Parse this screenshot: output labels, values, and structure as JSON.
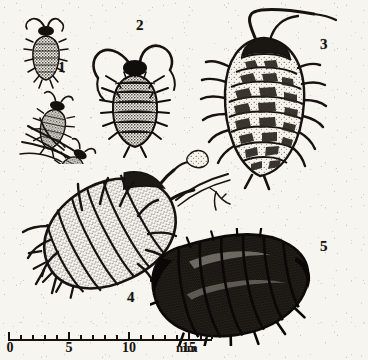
{
  "plate": {
    "title": "Woodlouse developmental series plate",
    "background_color": "#f7f5f0",
    "ink_color": "#151210",
    "width": 368,
    "height": 360
  },
  "figure_labels": [
    {
      "id": "1",
      "text": "1",
      "x": 58,
      "y": 60,
      "subject": "juvenile woodlice cluster"
    },
    {
      "id": "2",
      "text": "2",
      "x": 136,
      "y": 18,
      "subject": "young woodlouse with antennae"
    },
    {
      "id": "3",
      "text": "3",
      "x": 320,
      "y": 37,
      "subject": "large pale banded woodlouse"
    },
    {
      "id": "4",
      "text": "4",
      "x": 127,
      "y": 290,
      "subject": "speckled grey woodlouse"
    },
    {
      "id": "5",
      "text": "5",
      "x": 320,
      "y": 239,
      "subject": "dark glossy adult woodlouse"
    }
  ],
  "scale_bar": {
    "units": "mm",
    "unit_label": "mm",
    "min": 0,
    "max": 17,
    "labeled_ticks": [
      {
        "value": 0,
        "label": "0"
      },
      {
        "value": 5,
        "label": "5"
      },
      {
        "value": 10,
        "label": "10"
      },
      {
        "value": 15,
        "label": "15"
      }
    ],
    "minor_tick_interval": 1,
    "major_tick_interval": 5,
    "pixels_per_mm": 12,
    "origin_x": 8
  }
}
